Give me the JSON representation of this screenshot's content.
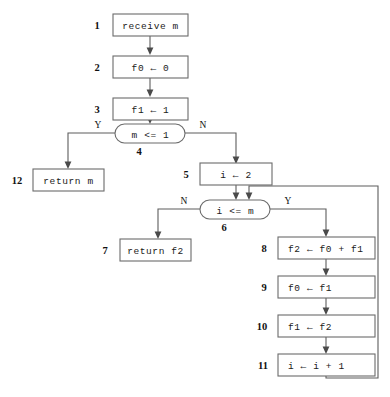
{
  "diagram": {
    "type": "flowchart",
    "colors": {
      "background": "#ffffff",
      "box_stroke": "#6b6b6b",
      "edge_stroke": "#5d5d5d",
      "text": "#1a1a1a"
    },
    "nodes": [
      {
        "step": "1",
        "text": "receive m",
        "shape": "rect"
      },
      {
        "step": "2",
        "text": "f0 ← 0",
        "shape": "rect"
      },
      {
        "step": "3",
        "text": "f1 ← 1",
        "shape": "rect"
      },
      {
        "step": "4",
        "text": "m <= 1",
        "shape": "decision"
      },
      {
        "step": "5",
        "text": "i ← 2",
        "shape": "rect"
      },
      {
        "step": "6",
        "text": "i <= m",
        "shape": "decision"
      },
      {
        "step": "7",
        "text": "return f2",
        "shape": "rect"
      },
      {
        "step": "8",
        "text": "f2 ← f0 + f1",
        "shape": "rect"
      },
      {
        "step": "9",
        "text": "f0 ← f1",
        "shape": "rect"
      },
      {
        "step": "10",
        "text": "f1 ← f2",
        "shape": "rect"
      },
      {
        "step": "11",
        "text": "i ← i + 1",
        "shape": "rect"
      },
      {
        "step": "12",
        "text": "return m",
        "shape": "rect"
      }
    ],
    "branch_labels": {
      "decision4_yes": "Y",
      "decision4_no": "N",
      "decision6_no": "N",
      "decision6_yes": "Y"
    }
  }
}
